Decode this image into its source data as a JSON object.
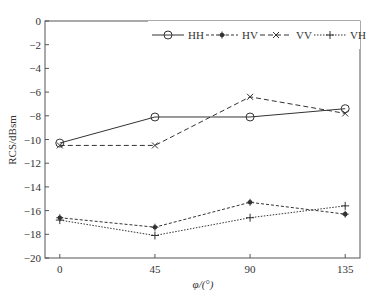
{
  "chart_data": {
    "type": "line",
    "title": "",
    "xlabel": "φ/(°)",
    "ylabel": "RCS/dBsm",
    "x": [
      0,
      45,
      90,
      135
    ],
    "xticks": [
      "0",
      "45",
      "90",
      "135"
    ],
    "yticks": [
      "0",
      "−2",
      "−4",
      "−6",
      "−8",
      "−10",
      "−12",
      "−14",
      "−16",
      "−18",
      "−20"
    ],
    "ylim": [
      -20,
      0
    ],
    "xlim": [
      -7,
      142
    ],
    "grid": false,
    "legend_position": "top-right",
    "series": [
      {
        "name": "HH",
        "values": [
          -10.3,
          -8.1,
          -8.1,
          -7.4
        ],
        "style": "solid",
        "marker": "circle"
      },
      {
        "name": "HV",
        "values": [
          -16.6,
          -17.4,
          -15.3,
          -16.3
        ],
        "style": "dashdot",
        "marker": "star"
      },
      {
        "name": "VV",
        "values": [
          -10.5,
          -10.5,
          -6.4,
          -7.8
        ],
        "style": "dashed",
        "marker": "x"
      },
      {
        "name": "VH",
        "values": [
          -16.8,
          -18.1,
          -16.6,
          -15.6
        ],
        "style": "dotted",
        "marker": "plus"
      }
    ]
  },
  "colors": {
    "line": "#333333",
    "axis": "#555555",
    "background": "#ffffff"
  }
}
